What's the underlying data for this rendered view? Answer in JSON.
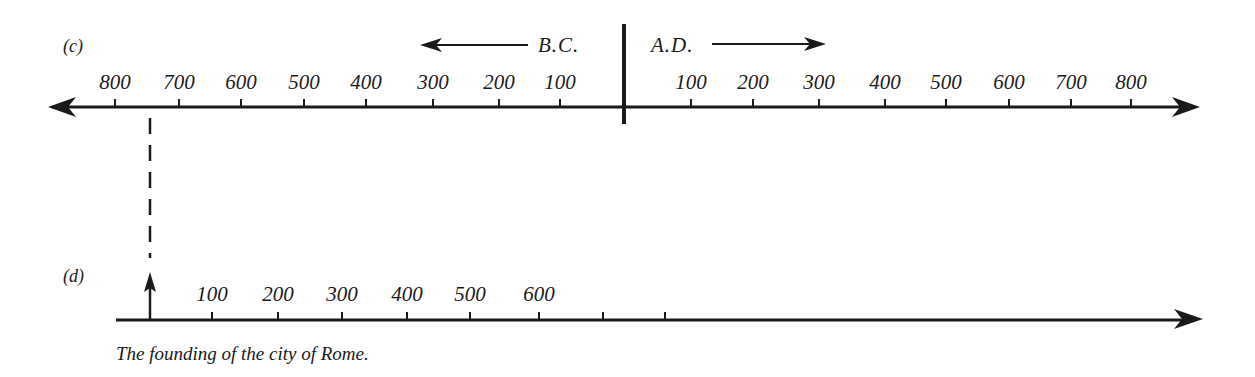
{
  "timeline_c": {
    "label": "(c)",
    "bc_label": "B.C.",
    "ad_label": "A.D.",
    "bc_ticks": [
      {
        "label": "800",
        "x": 115
      },
      {
        "label": "700",
        "x": 179
      },
      {
        "label": "600",
        "x": 241
      },
      {
        "label": "500",
        "x": 304
      },
      {
        "label": "400",
        "x": 366
      },
      {
        "label": "300",
        "x": 433
      },
      {
        "label": "200",
        "x": 499
      },
      {
        "label": "100",
        "x": 560
      }
    ],
    "ad_ticks": [
      {
        "label": "100",
        "x": 691
      },
      {
        "label": "200",
        "x": 753
      },
      {
        "label": "300",
        "x": 819
      },
      {
        "label": "400",
        "x": 885
      },
      {
        "label": "500",
        "x": 946
      },
      {
        "label": "600",
        "x": 1009
      },
      {
        "label": "700",
        "x": 1071
      },
      {
        "label": "800",
        "x": 1131
      }
    ]
  },
  "timeline_d": {
    "label": "(d)",
    "ticks": [
      {
        "label": "100",
        "x": 212
      },
      {
        "label": "200",
        "x": 278
      },
      {
        "label": "300",
        "x": 342
      },
      {
        "label": "400",
        "x": 407
      },
      {
        "label": "500",
        "x": 470
      },
      {
        "label": "600",
        "x": 539
      },
      {
        "label": "",
        "x": 603
      },
      {
        "label": "",
        "x": 665
      }
    ],
    "caption": "The founding of the city of Rome."
  },
  "colors": {
    "ink": "#1a1a1a",
    "paper": "#ffffff"
  }
}
